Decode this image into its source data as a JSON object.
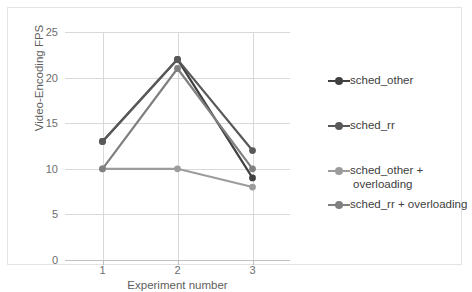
{
  "chart_data": {
    "type": "line",
    "title": "",
    "xlabel": "Experiment number",
    "ylabel": "Video-Encoding FPS",
    "categories": [
      "1",
      "2",
      "3"
    ],
    "x": [
      1,
      2,
      3
    ],
    "xlim": [
      0.5,
      3.5
    ],
    "ylim": [
      0,
      25
    ],
    "yticks": [
      0,
      5,
      10,
      15,
      20,
      25
    ],
    "ytick_labels": [
      "0",
      "5",
      "10",
      "15",
      "20",
      "25"
    ],
    "xtick_labels": [
      "1",
      "2",
      "3"
    ],
    "grid": "horizontal",
    "legend_position": "right",
    "series": [
      {
        "name": "sched_other",
        "values": [
          13,
          22,
          9
        ],
        "color": "#404040",
        "marker": "circle"
      },
      {
        "name": "sched_rr",
        "values": [
          13,
          22,
          12
        ],
        "color": "#595959",
        "marker": "circle"
      },
      {
        "name": "sched_other + overloading",
        "values": [
          10,
          10,
          8
        ],
        "color": "#9c9c9c",
        "marker": "circle"
      },
      {
        "name": "sched_rr + overloading",
        "values": [
          10,
          21,
          10
        ],
        "color": "#808080",
        "marker": "circle"
      }
    ]
  },
  "axes": {
    "y_title": "Video-Encoding FPS",
    "x_title": "Experiment number",
    "y_tick_labels": [
      "25",
      "20",
      "15",
      "10",
      "5",
      "0"
    ],
    "x_tick_labels": [
      "1",
      "2",
      "3"
    ]
  },
  "legend": {
    "items": [
      {
        "label": "sched_other",
        "color": "#404040"
      },
      {
        "label": "sched_rr",
        "color": "#595959"
      },
      {
        "label": "sched_other +",
        "label2": "overloading",
        "color": "#9c9c9c"
      },
      {
        "label": "sched_rr + overloading",
        "color": "#808080"
      }
    ]
  },
  "colors": {
    "gridline": "#d9d9d9",
    "axis": "#bfbfbf",
    "frame": "#e3e3e3",
    "tick_text": "#6d6d6d",
    "title_text": "#5e5e5e",
    "legend_text": "#404040",
    "background": "#ffffff"
  }
}
